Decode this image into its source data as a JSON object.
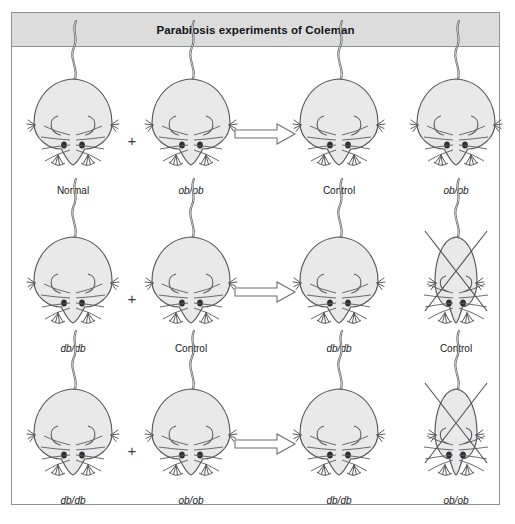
{
  "figure": {
    "title": "Parabiosis experiments of Coleman",
    "colors": {
      "title_bar_bg": "#dcdcdc",
      "frame_border": "#8e9194",
      "mouse_fill": "#e9e9e9",
      "mouse_stroke": "#58595b",
      "page_bg": "#ffffff",
      "text": "#16181b"
    }
  },
  "separators": {
    "plus": "+",
    "arrow_icon": "right-arrow-icon"
  },
  "rows": [
    {
      "id": "row-obob-normal",
      "pair": [
        {
          "label": "Normal",
          "genotype": false,
          "build": "obese",
          "dead": false
        },
        {
          "label": "ob/ob",
          "genotype": true,
          "build": "obese",
          "dead": false
        }
      ],
      "outcome": [
        {
          "label": "Control",
          "genotype": false,
          "build": "obese",
          "dead": false
        },
        {
          "label": "ob/ob",
          "genotype": true,
          "build": "obese",
          "dead": false
        }
      ]
    },
    {
      "id": "row-dbdb-control",
      "pair": [
        {
          "label": "db/db",
          "genotype": true,
          "build": "obese",
          "dead": false
        },
        {
          "label": "Control",
          "genotype": false,
          "build": "obese",
          "dead": false
        }
      ],
      "outcome": [
        {
          "label": "db/db",
          "genotype": true,
          "build": "obese",
          "dead": false
        },
        {
          "label": "Control",
          "genotype": false,
          "build": "thin",
          "dead": true
        }
      ]
    },
    {
      "id": "row-dbdb-obob",
      "pair": [
        {
          "label": "db/db",
          "genotype": true,
          "build": "obese",
          "dead": false
        },
        {
          "label": "ob/ob",
          "genotype": true,
          "build": "obese",
          "dead": false
        }
      ],
      "outcome": [
        {
          "label": "db/db",
          "genotype": true,
          "build": "obese",
          "dead": false
        },
        {
          "label": "ob/ob",
          "genotype": true,
          "build": "thin",
          "dead": true
        }
      ]
    }
  ],
  "layout": {
    "mouse_centers_x": [
      61,
      179,
      327,
      444
    ],
    "plus_x": [
      120,
      120,
      120
    ],
    "arrow_x": 253
  }
}
